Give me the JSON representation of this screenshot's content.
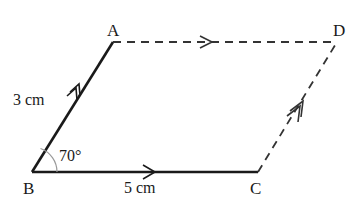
{
  "figure": {
    "type": "parallelogram",
    "vertices": {
      "A": {
        "label": "A"
      },
      "B": {
        "label": "B"
      },
      "C": {
        "label": "C"
      },
      "D": {
        "label": "D"
      }
    },
    "sides": {
      "AB": {
        "label": "3 cm",
        "style": "solid",
        "arrow": "double"
      },
      "BC": {
        "label": "5 cm",
        "style": "solid",
        "arrow": "single"
      },
      "AD": {
        "label": "",
        "style": "dashed",
        "arrow": "single"
      },
      "CD": {
        "label": "",
        "style": "dashed",
        "arrow": "double"
      }
    },
    "angle": {
      "vertex": "B",
      "label": "70°",
      "value_degrees": 70
    },
    "colors": {
      "line": "#1a1a1a",
      "angle_arc": "#999999"
    }
  }
}
